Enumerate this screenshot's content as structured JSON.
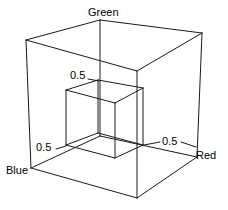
{
  "figure": {
    "type": "wireframe-3d-diagram",
    "width": 228,
    "height": 210,
    "background_color": "#ffffff",
    "line_color": "#1a1a1a"
  },
  "axes": [
    {
      "id": "green",
      "label": "Green",
      "direction": "up"
    },
    {
      "id": "red",
      "label": "Red",
      "direction": "right-down"
    },
    {
      "id": "blue",
      "label": "Blue",
      "direction": "left-down"
    }
  ],
  "ticks": [
    {
      "id": "green-half",
      "axis": "green",
      "label": "0.5",
      "value": 0.5
    },
    {
      "id": "blue-half",
      "axis": "blue",
      "label": "0.5",
      "value": 0.5
    },
    {
      "id": "red-half",
      "axis": "red",
      "label": "0.5",
      "value": 0.5
    }
  ],
  "labels": {
    "green": "Green",
    "red": "Red",
    "blue": "Blue",
    "tick_green": "0.5",
    "tick_blue": "0.5",
    "tick_red": "0.5"
  },
  "chart_data": {
    "type": "scatter",
    "xlabel": "Red",
    "ylabel": "Green",
    "zlabel": "Blue",
    "xlim": [
      0,
      1
    ],
    "ylim": [
      0,
      1
    ],
    "zlim": [
      0,
      1
    ],
    "grid": false,
    "legend": "none",
    "annotations": [
      "0.5",
      "0.5",
      "0.5"
    ],
    "shapes": [
      {
        "name": "outer-cube",
        "kind": "box",
        "min": [
          0,
          0,
          0
        ],
        "max": [
          1,
          1,
          1
        ],
        "style": "wireframe"
      },
      {
        "name": "inner-cube",
        "kind": "box",
        "min": [
          0,
          0,
          0
        ],
        "max": [
          0.5,
          0.5,
          0.5
        ],
        "style": "wireframe"
      }
    ]
  },
  "geometry": {
    "outer": {
      "origin_blue": [
        31,
        168
      ],
      "front_bottom": [
        137,
        198
      ],
      "right_bottom_red": [
        197,
        157
      ],
      "back_bottom": [
        100,
        136
      ],
      "left_top": [
        26,
        40
      ],
      "front_top": [
        137,
        71
      ],
      "right_top": [
        202,
        33
      ],
      "back_top_green": [
        100,
        20
      ]
    },
    "inner": {
      "left_bottom": [
        66,
        145
      ],
      "front_bottom": [
        115,
        158
      ],
      "right_bottom": [
        143,
        145
      ],
      "back_bottom": [
        98,
        133
      ],
      "left_top": [
        66,
        90
      ],
      "front_top": [
        115,
        103
      ],
      "right_top": [
        143,
        88
      ],
      "back_top": [
        98,
        80
      ]
    }
  }
}
